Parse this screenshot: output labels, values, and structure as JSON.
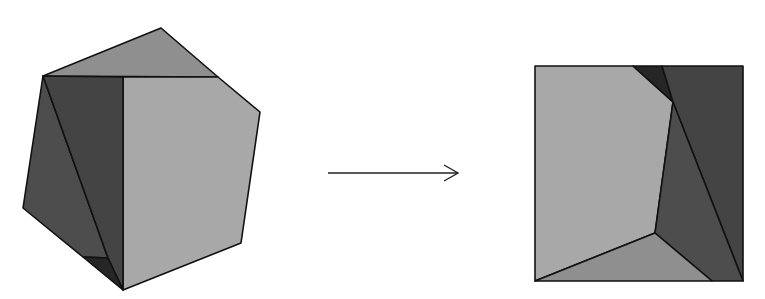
{
  "diagram": {
    "type": "dissection",
    "colors": {
      "light": "#a8a8a8",
      "mid": "#8f8f8f",
      "dark": "#4d4d4d",
      "darker": "#444444",
      "darkest": "#262626",
      "stroke": "#111111",
      "arrow": "#222222"
    },
    "source_shape": {
      "name": "pentagon",
      "pieces": [
        {
          "id": "top-triangle",
          "fill": "mid",
          "points": "43,76 161,28 218,77"
        },
        {
          "id": "right-piece",
          "fill": "light",
          "points": "123,77 218,77 260,112 241,243 123,290"
        },
        {
          "id": "left-dark-piece",
          "fill": "dark",
          "points": "43,76 23,208 83,257 108,258"
        },
        {
          "id": "middle-dark-piece",
          "fill": "darker",
          "points": "43,76 123,77 123,290 108,258"
        },
        {
          "id": "bottom-dark-triangle",
          "fill": "darkest",
          "points": "83,257 108,258 123,290"
        }
      ]
    },
    "arrow": {
      "x1": 328,
      "y1": 173,
      "x2": 458,
      "y2": 173
    },
    "target_shape": {
      "name": "square",
      "pieces": [
        {
          "id": "light-piece",
          "fill": "light",
          "points": "535,66 633,66 673,102 655,233 535,281"
        },
        {
          "id": "top-dark-triangle",
          "fill": "darkest",
          "points": "633,66 662,66 673,102"
        },
        {
          "id": "right-dark-piece",
          "fill": "darker",
          "points": "662,66 743,66 743,281 673,102"
        },
        {
          "id": "middle-dark-piece",
          "fill": "dark",
          "points": "673,102 743,281 712,281 655,233"
        },
        {
          "id": "bottom-triangle",
          "fill": "mid",
          "points": "535,281 655,233 712,281"
        }
      ]
    }
  }
}
